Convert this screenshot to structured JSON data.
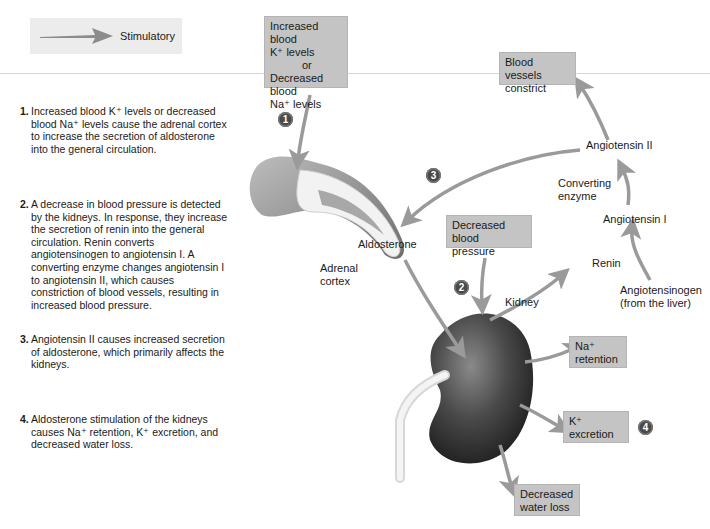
{
  "legend": {
    "label": "Stimulatory",
    "icon": "stimulatory-arrow-icon"
  },
  "colors": {
    "box_fill": "#c4c4c4",
    "arrow": "#9a9a9a",
    "badge": "#4a4a4a",
    "legend_bg": "#ececec"
  },
  "steps": [
    {
      "num": "1.",
      "text": "Increased blood K⁺ levels or decreased blood Na⁺ levels cause the adrenal cortex to increase the secretion of aldosterone into the general circulation."
    },
    {
      "num": "2.",
      "text": "A decrease in blood pressure is detected by the kidneys. In response, they increase the secretion of renin into the general circulation. Renin converts angiotensinogen to angiotensin I. A converting enzyme changes angiotensin I to angiotensin II, which causes constriction of blood vessels, resulting in increased blood pressure."
    },
    {
      "num": "3.",
      "text": "Angiotensin II causes increased secretion of aldosterone, which primarily affects the kidneys."
    },
    {
      "num": "4.",
      "text": "Aldosterone stimulation of the kidneys causes Na⁺ retention, K⁺ excretion, and decreased water loss."
    }
  ],
  "boxes": {
    "stimulus": {
      "line1": "Increased blood",
      "line2": "K⁺ levels",
      "line3": "or",
      "line4": "Decreased blood",
      "line5": "Na⁺ levels"
    },
    "vessels": {
      "line1": "Blood vessels",
      "line2": "constrict"
    },
    "pressure": {
      "line1": "Decreased blood",
      "line2": "pressure"
    },
    "na": {
      "line1": "Na⁺",
      "line2": "retention"
    },
    "k": {
      "line1": "K⁺",
      "line2": "excretion"
    },
    "water": {
      "line1": "Decreased",
      "line2": "water loss"
    }
  },
  "labels": {
    "angiotensin2": "Angiotensin II",
    "converting1": "Converting",
    "converting2": "enzyme",
    "angiotensin1": "Angiotensin I",
    "renin": "Renin",
    "angiotensinogen1": "Angiotensinogen",
    "angiotensinogen2": "(from the liver)",
    "aldosterone": "Aldosterone",
    "adrenal1": "Adrenal",
    "adrenal2": "cortex",
    "kidney": "Kidney"
  },
  "badges": [
    "1",
    "2",
    "3",
    "4"
  ]
}
